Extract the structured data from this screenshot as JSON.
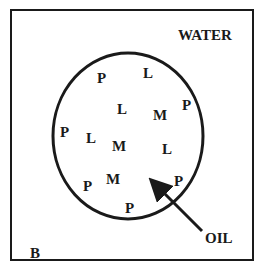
{
  "diagram": {
    "labels": {
      "water": "WATER",
      "oil": "OIL",
      "panel": "B"
    },
    "particles": [
      {
        "letter": "P",
        "x": 97,
        "y": 71
      },
      {
        "letter": "L",
        "x": 143,
        "y": 66
      },
      {
        "letter": "L",
        "x": 117,
        "y": 102
      },
      {
        "letter": "M",
        "x": 153,
        "y": 108
      },
      {
        "letter": "P",
        "x": 182,
        "y": 98
      },
      {
        "letter": "P",
        "x": 60,
        "y": 125
      },
      {
        "letter": "L",
        "x": 86,
        "y": 131
      },
      {
        "letter": "M",
        "x": 112,
        "y": 139
      },
      {
        "letter": "L",
        "x": 162,
        "y": 142
      },
      {
        "letter": "M",
        "x": 106,
        "y": 172
      },
      {
        "letter": "P",
        "x": 83,
        "y": 179
      },
      {
        "letter": "P",
        "x": 174,
        "y": 174
      },
      {
        "letter": "P",
        "x": 125,
        "y": 201
      }
    ]
  }
}
